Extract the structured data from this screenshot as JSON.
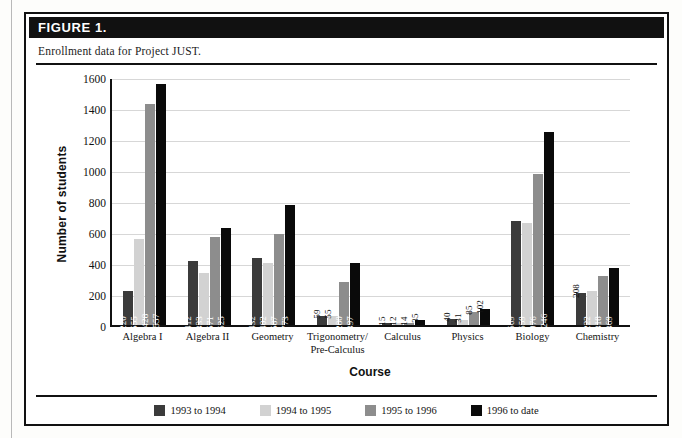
{
  "figure": {
    "label": "FIGURE 1.",
    "caption": "Enrollment data for Project JUST."
  },
  "chart_data": {
    "type": "bar",
    "title": "Enrollment data for Project JUST.",
    "xlabel": "Course",
    "ylabel": "Number of students",
    "ylim": [
      0,
      1600
    ],
    "yticks": [
      "0",
      "200",
      "400",
      "600",
      "800",
      "1000",
      "1200",
      "1400",
      "1600"
    ],
    "grid": true,
    "legend_position": "bottom",
    "categories": [
      "Algebra I",
      "Algebra II",
      "Geometry",
      "Trigonometry/\nPre-Calculus",
      "Calculus",
      "Physics",
      "Biology",
      "Chemistry"
    ],
    "series": [
      {
        "name": "1993 to 1994",
        "color": "#3b3b3b",
        "values": [
          220,
          412,
          432,
          59,
          15,
          40,
          669,
          208
        ]
      },
      {
        "name": "1994 to 1995",
        "color": "#d2d2d2",
        "values": [
          555,
          333,
          402,
          55,
          12,
          31,
          659,
          222
        ]
      },
      {
        "name": "1995 to 1996",
        "color": "#8d8d8d",
        "values": [
          1428,
          571,
          587,
          280,
          14,
          85,
          976,
          318
        ]
      },
      {
        "name": "1996 to date",
        "color": "#0a0a0a",
        "values": [
          1557,
          625,
          773,
          397,
          35,
          102,
          1246,
          369
        ]
      }
    ]
  }
}
